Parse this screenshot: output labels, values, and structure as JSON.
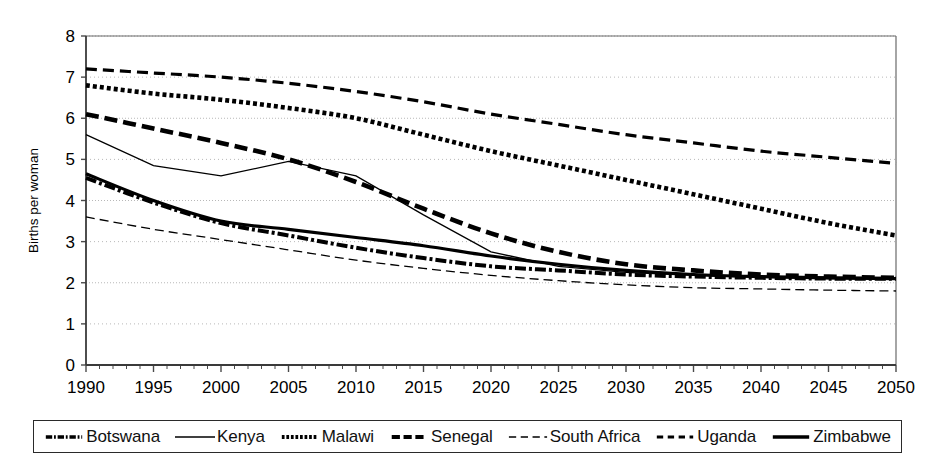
{
  "chart_data": {
    "type": "line",
    "title": "",
    "xlabel": "",
    "ylabel": "Births per woman",
    "xlim": [
      1990,
      2050
    ],
    "ylim": [
      0,
      8
    ],
    "grid": true,
    "legend_position": "bottom",
    "x_ticks": [
      "1990",
      "1995",
      "2000",
      "2005",
      "2010",
      "2015",
      "2020",
      "2025",
      "2030",
      "2035",
      "2040",
      "2045",
      "2050"
    ],
    "y_ticks": [
      "0",
      "1",
      "2",
      "3",
      "4",
      "5",
      "6",
      "7",
      "8"
    ],
    "x": [
      1990,
      1995,
      2000,
      2005,
      2010,
      2015,
      2020,
      2025,
      2030,
      2035,
      2040,
      2045,
      2050
    ],
    "series": [
      {
        "name": "Botswana",
        "style": "dash-dot",
        "values": [
          4.55,
          3.95,
          3.45,
          3.15,
          2.85,
          2.6,
          2.4,
          2.3,
          2.2,
          2.15,
          2.12,
          2.1,
          2.1
        ]
      },
      {
        "name": "Kenya",
        "style": "thin-solid",
        "values": [
          5.6,
          4.85,
          4.6,
          4.95,
          4.6,
          3.65,
          2.75,
          2.4,
          2.25,
          2.18,
          2.13,
          2.1,
          2.1
        ]
      },
      {
        "name": "Malawi",
        "style": "dotted",
        "values": [
          6.8,
          6.6,
          6.45,
          6.25,
          6.0,
          5.6,
          5.2,
          4.85,
          4.5,
          4.15,
          3.8,
          3.45,
          3.15
        ]
      },
      {
        "name": "Senegal",
        "style": "thick-dash",
        "values": [
          6.1,
          5.75,
          5.4,
          5.0,
          4.45,
          3.8,
          3.2,
          2.75,
          2.45,
          2.3,
          2.2,
          2.15,
          2.12
        ]
      },
      {
        "name": "South Africa",
        "style": "thin-dash",
        "values": [
          3.6,
          3.3,
          3.05,
          2.8,
          2.55,
          2.35,
          2.18,
          2.05,
          1.95,
          1.88,
          1.85,
          1.82,
          1.8
        ]
      },
      {
        "name": "Uganda",
        "style": "dashed",
        "values": [
          7.2,
          7.1,
          7.0,
          6.85,
          6.65,
          6.4,
          6.1,
          5.85,
          5.6,
          5.4,
          5.2,
          5.05,
          4.9
        ]
      },
      {
        "name": "Zimbabwe",
        "style": "thick-solid",
        "values": [
          4.65,
          4.0,
          3.5,
          3.3,
          3.1,
          2.9,
          2.65,
          2.45,
          2.3,
          2.2,
          2.15,
          2.12,
          2.1
        ]
      }
    ]
  },
  "legend": {
    "items": [
      {
        "label": "Botswana",
        "style": "dash-dot"
      },
      {
        "label": "Kenya",
        "style": "thin-solid"
      },
      {
        "label": "Malawi",
        "style": "dotted"
      },
      {
        "label": "Senegal",
        "style": "thick-dash"
      },
      {
        "label": "South Africa",
        "style": "thin-dash"
      },
      {
        "label": "Uganda",
        "style": "dashed"
      },
      {
        "label": "Zimbabwe",
        "style": "thick-solid"
      }
    ]
  },
  "colors": {
    "line": "#000000",
    "grid": "#b8b8b8",
    "axis": "#4a4a4a",
    "background": "#ffffff"
  }
}
